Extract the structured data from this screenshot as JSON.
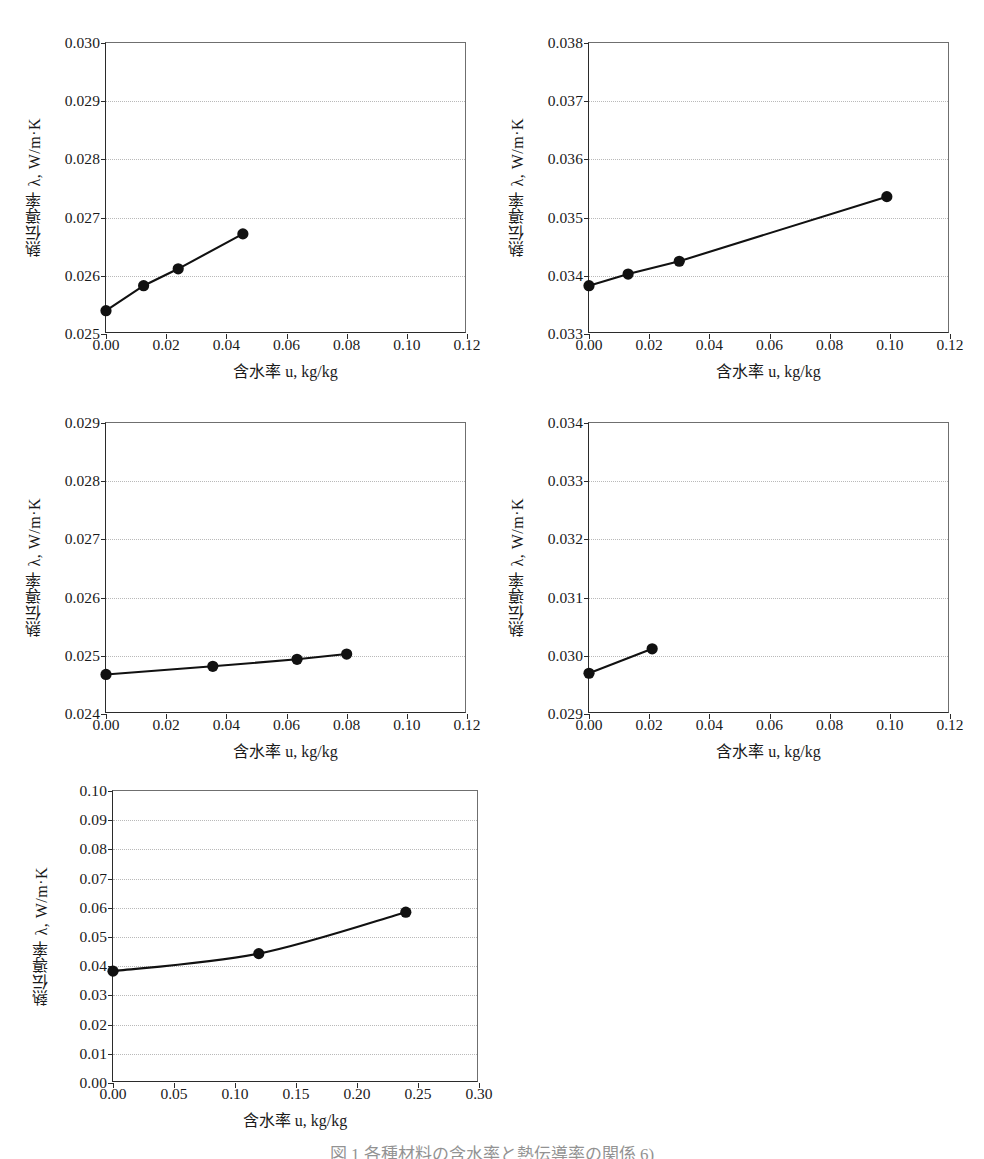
{
  "figure": {
    "caption": "図 1 各種材料の含水率と熱伝導率の関係 6)",
    "axis": {
      "xlabel": "含水率 u, kg/kg",
      "ylabel": "熱伝導率 λ, W/m·K"
    }
  },
  "chart_data": [
    {
      "id": "chart-7",
      "type": "line",
      "index": "(7)",
      "title": "Rigid polyurethane foamed HCFC141",
      "density_label": "( ρ = 28 kg / m3 )",
      "density_value": 28,
      "density_unit": "kg/m3",
      "xlabel": "含水率 u, kg/kg",
      "ylabel": "熱伝導率 λ, W/m·K",
      "xlim": [
        0.0,
        0.12
      ],
      "ylim": [
        0.025,
        0.03
      ],
      "xticks": [
        "0.00",
        "0.02",
        "0.04",
        "0.06",
        "0.08",
        "0.10",
        "0.12"
      ],
      "yticks": [
        "0.025",
        "0.026",
        "0.027",
        "0.028",
        "0.029",
        "0.030"
      ],
      "grid": true,
      "x": [
        0.0,
        0.0125,
        0.024,
        0.0455
      ],
      "y": [
        0.0254,
        0.02583,
        0.02612,
        0.02672
      ]
    },
    {
      "id": "chart-8",
      "type": "line",
      "index": "(8)",
      "title": "Rigid polyurethane foamed water",
      "density_label": "( ρ = 38 kg / m3 )",
      "density_value": 38,
      "density_unit": "kg/m3",
      "xlabel": "含水率 u, kg/kg",
      "ylabel": "熱伝導率 λ, W/m·K",
      "xlim": [
        0.0,
        0.12
      ],
      "ylim": [
        0.033,
        0.038
      ],
      "xticks": [
        "0.00",
        "0.02",
        "0.04",
        "0.06",
        "0.08",
        "0.10",
        "0.12"
      ],
      "yticks": [
        "0.033",
        "0.034",
        "0.035",
        "0.036",
        "0.037",
        "0.038"
      ],
      "grid": true,
      "x": [
        0.0,
        0.013,
        0.03,
        0.099
      ],
      "y": [
        0.03383,
        0.03403,
        0.03425,
        0.03536
      ]
    },
    {
      "id": "chart-9",
      "type": "line",
      "index": "(9)",
      "title": "Phenolic foam",
      "density_label": "( ρ = 24 kg / m3 )",
      "density_value": 24,
      "density_unit": "kg/m3",
      "title_inline": true,
      "xlabel": "含水率 u, kg/kg",
      "ylabel": "熱伝導率 λ, W/m·K",
      "xlim": [
        0.0,
        0.12
      ],
      "ylim": [
        0.024,
        0.029
      ],
      "xticks": [
        "0.00",
        "0.02",
        "0.04",
        "0.06",
        "0.08",
        "0.10",
        "0.12"
      ],
      "yticks": [
        "0.024",
        "0.025",
        "0.026",
        "0.027",
        "0.028",
        "0.029"
      ],
      "grid": true,
      "x": [
        0.0,
        0.0355,
        0.0635,
        0.08
      ],
      "y": [
        0.02468,
        0.02482,
        0.02494,
        0.02503
      ]
    },
    {
      "id": "chart-10",
      "type": "line",
      "index": "(10)",
      "title": "Extrided polystyrene foam",
      "density_label": "( ρ = 34 kg / m3 )",
      "density_value": 34,
      "density_unit": "kg/m3",
      "xlabel": "含水率 u, kg/kg",
      "ylabel": "熱伝導率 λ, W/m·K",
      "xlim": [
        0.0,
        0.12
      ],
      "ylim": [
        0.029,
        0.034
      ],
      "xticks": [
        "0.00",
        "0.02",
        "0.04",
        "0.06",
        "0.08",
        "0.10",
        "0.12"
      ],
      "yticks": [
        "0.029",
        "0.030",
        "0.031",
        "0.032",
        "0.033",
        "0.034"
      ],
      "grid": true,
      "x": [
        0.0,
        0.021
      ],
      "y": [
        0.0297,
        0.03012
      ]
    },
    {
      "id": "chart-11",
      "type": "line",
      "index": "(11)",
      "title": "Cellulose fibre",
      "density_label": "( ρ = − kg / m3 )",
      "density_value": null,
      "density_unit": "kg/m3",
      "title_inline": true,
      "xlabel": "含水率 u, kg/kg",
      "ylabel": "熱伝導率 λ, W/m·K",
      "xlim": [
        0.0,
        0.3
      ],
      "ylim": [
        0.0,
        0.1
      ],
      "xticks": [
        "0.00",
        "0.05",
        "0.10",
        "0.15",
        "0.20",
        "0.25",
        "0.30"
      ],
      "yticks": [
        "0.00",
        "0.01",
        "0.02",
        "0.03",
        "0.04",
        "0.05",
        "0.06",
        "0.07",
        "0.08",
        "0.09",
        "0.10"
      ],
      "grid": true,
      "curved": true,
      "x": [
        0.0,
        0.1195,
        0.24
      ],
      "y": [
        0.0383,
        0.0443,
        0.0585
      ]
    }
  ]
}
